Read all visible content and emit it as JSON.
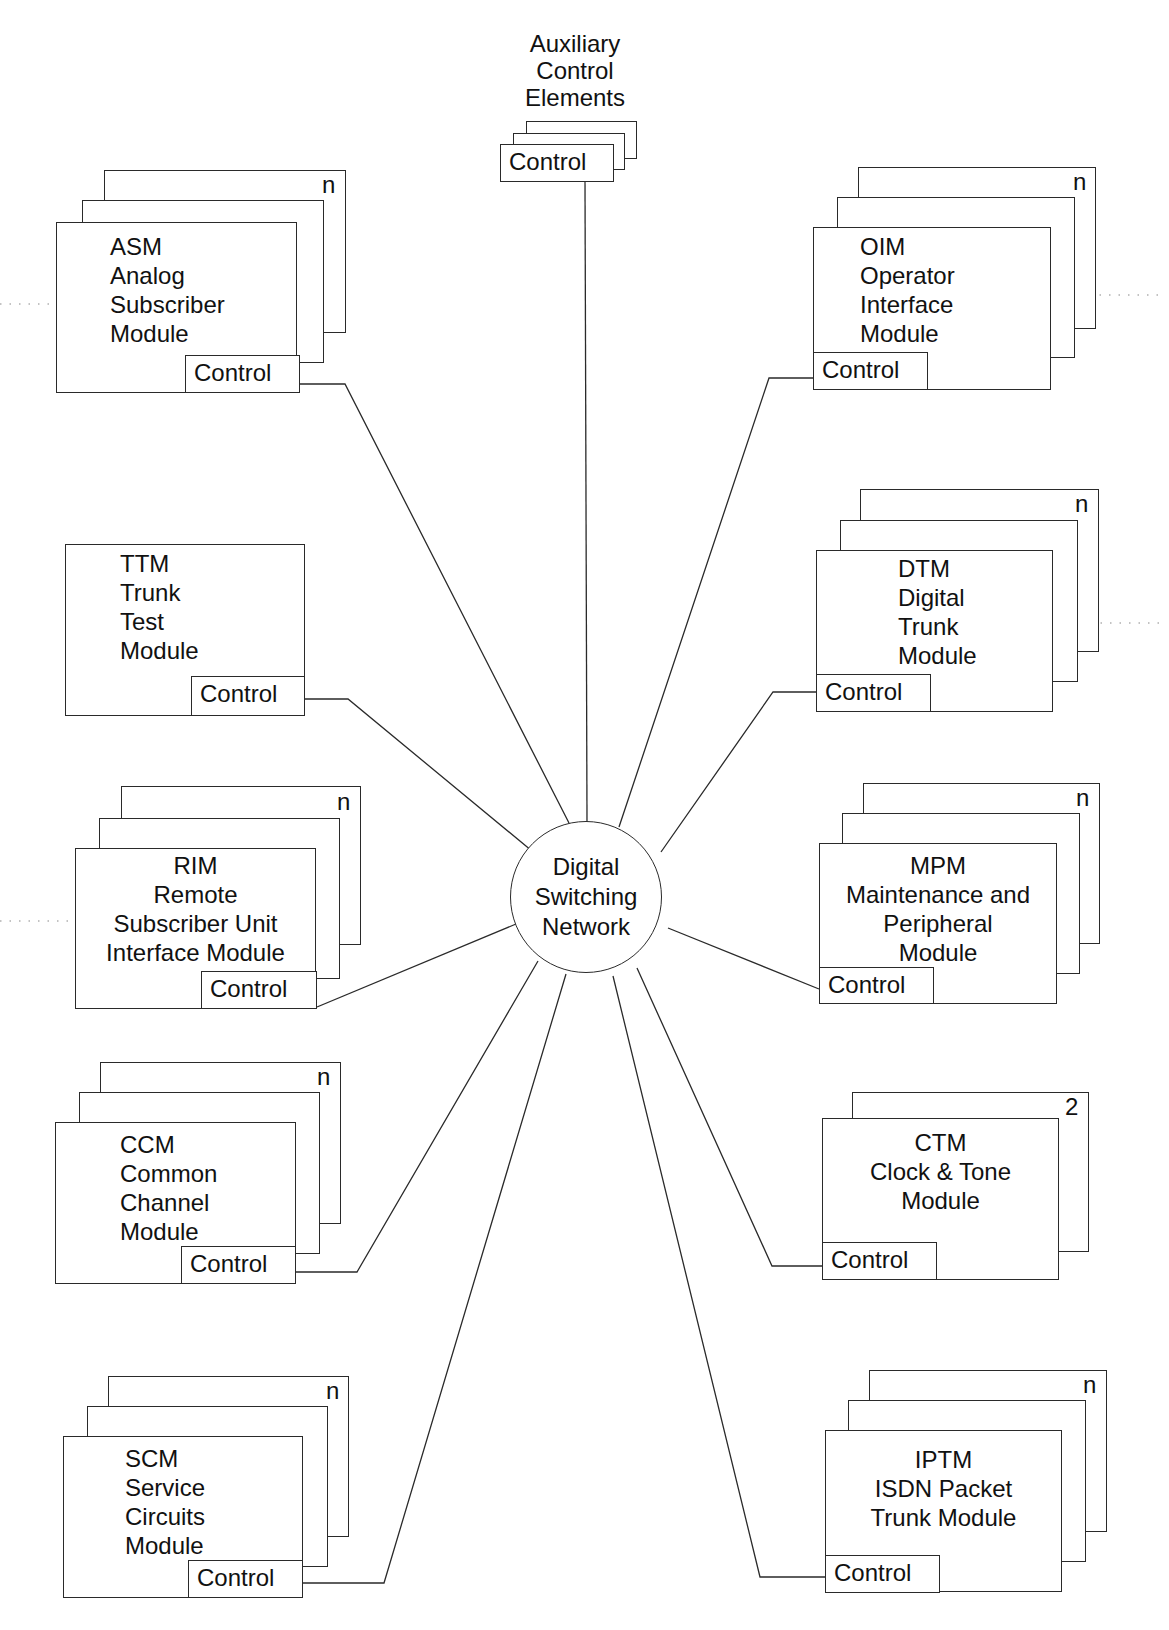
{
  "diagram": {
    "hub": {
      "label": "Digital\nSwitching\nNetwork",
      "cx": 586,
      "cy": 897,
      "r": 76
    },
    "auxiliary": {
      "title": "Auxiliary\nControl\nElements",
      "control_label": "Control",
      "title_box": [
        500,
        30,
        150,
        85
      ],
      "cards": [
        [
          526,
          121,
          111,
          38
        ],
        [
          513,
          133,
          112,
          37
        ],
        [
          500,
          144,
          114,
          38
        ]
      ]
    },
    "modules": [
      {
        "id": "asm",
        "title": "ASM\nAnalog\nSubscriber\nModule",
        "count": "n",
        "control_label": "Control",
        "cards": [
          [
            104,
            170,
            242,
            163
          ],
          [
            82,
            200,
            242,
            163
          ],
          [
            56,
            222,
            241,
            171
          ]
        ],
        "title_box": [
          110,
          232,
          130,
          120
        ],
        "title_align": "left",
        "control": [
          185,
          355,
          115,
          38
        ],
        "count_pos": [
          322,
          172
        ],
        "dotted": [
          [
            0,
            304,
            55,
            304
          ]
        ]
      },
      {
        "id": "oim",
        "title": "OIM\nOperator\nInterface\nModule",
        "count": "n",
        "control_label": "Control",
        "cards": [
          [
            858,
            167,
            238,
            162
          ],
          [
            837,
            197,
            238,
            161
          ],
          [
            813,
            227,
            238,
            163
          ]
        ],
        "title_box": [
          860,
          232,
          130,
          120
        ],
        "title_align": "left",
        "control": [
          813,
          352,
          115,
          38
        ],
        "count_pos": [
          1073,
          169
        ],
        "dotted": [
          [
            1052,
            295,
            1160,
            295
          ]
        ]
      },
      {
        "id": "ttm",
        "title": "TTM\nTrunk\nTest\nModule",
        "count": "",
        "control_label": "Control",
        "cards": [
          [
            65,
            544,
            240,
            172
          ]
        ],
        "title_box": [
          120,
          549,
          110,
          120
        ],
        "title_align": "left",
        "control": [
          191,
          676,
          114,
          40
        ],
        "count_pos": [
          0,
          0
        ],
        "dotted": []
      },
      {
        "id": "dtm",
        "title": "DTM\nDigital\nTrunk\nModule",
        "count": "n",
        "control_label": "Control",
        "cards": [
          [
            860,
            489,
            239,
            163
          ],
          [
            840,
            520,
            238,
            162
          ],
          [
            816,
            550,
            237,
            162
          ]
        ],
        "title_box": [
          898,
          554,
          120,
          116
        ],
        "title_align": "left",
        "control": [
          816,
          674,
          115,
          38
        ],
        "count_pos": [
          1075,
          491
        ],
        "dotted": [
          [
            1053,
            623,
            1160,
            623
          ]
        ]
      },
      {
        "id": "rim",
        "title": "RIM\nRemote\nSubscriber Unit\nInterface Module",
        "count": "n",
        "control_label": "Control",
        "cards": [
          [
            121,
            786,
            240,
            159
          ],
          [
            99,
            818,
            241,
            161
          ],
          [
            75,
            848,
            241,
            161
          ]
        ],
        "title_box": [
          75,
          851,
          241,
          120
        ],
        "title_align": "center",
        "control": [
          201,
          971,
          116,
          38
        ],
        "count_pos": [
          337,
          789
        ],
        "dotted": [
          [
            0,
            921,
            74,
            921
          ]
        ]
      },
      {
        "id": "mpm",
        "title": "MPM\nMaintenance and\nPeripheral\nModule",
        "count": "n",
        "control_label": "Control",
        "cards": [
          [
            863,
            783,
            237,
            161
          ],
          [
            842,
            813,
            238,
            161
          ],
          [
            819,
            843,
            238,
            161
          ]
        ],
        "title_box": [
          819,
          851,
          238,
          116
        ],
        "title_align": "center",
        "control": [
          819,
          967,
          115,
          37
        ],
        "count_pos": [
          1076,
          785
        ],
        "dotted": []
      },
      {
        "id": "ccm",
        "title": "CCM\nCommon\nChannel\nModule",
        "count": "n",
        "control_label": "Control",
        "cards": [
          [
            100,
            1062,
            241,
            162
          ],
          [
            79,
            1092,
            241,
            162
          ],
          [
            55,
            1122,
            241,
            162
          ]
        ],
        "title_box": [
          120,
          1130,
          120,
          120
        ],
        "title_align": "left",
        "control": [
          181,
          1246,
          115,
          38
        ],
        "count_pos": [
          317,
          1064
        ],
        "dotted": []
      },
      {
        "id": "ctm",
        "title": "CTM\nClock & Tone\nModule",
        "count": "2",
        "control_label": "Control",
        "cards": [
          [
            852,
            1092,
            237,
            160
          ],
          [
            822,
            1118,
            237,
            162
          ]
        ],
        "title_box": [
          822,
          1128,
          237,
          100
        ],
        "title_align": "center",
        "control": [
          822,
          1242,
          115,
          38
        ],
        "count_pos": [
          1065,
          1094
        ],
        "dotted": []
      },
      {
        "id": "scm",
        "title": "SCM\nService\nCircuits\nModule",
        "count": "n",
        "control_label": "Control",
        "cards": [
          [
            108,
            1376,
            241,
            161
          ],
          [
            87,
            1406,
            241,
            161
          ],
          [
            63,
            1436,
            240,
            162
          ]
        ],
        "title_box": [
          125,
          1444,
          120,
          120
        ],
        "title_align": "left",
        "control": [
          188,
          1560,
          115,
          38
        ],
        "count_pos": [
          326,
          1378
        ],
        "dotted": []
      },
      {
        "id": "iptm",
        "title": "IPTM\nISDN Packet\nTrunk Module",
        "count": "n",
        "control_label": "Control",
        "cards": [
          [
            869,
            1370,
            238,
            162
          ],
          [
            848,
            1400,
            238,
            162
          ],
          [
            825,
            1430,
            237,
            162
          ]
        ],
        "title_box": [
          825,
          1445,
          237,
          100
        ],
        "title_align": "center",
        "control": [
          825,
          1555,
          115,
          38
        ],
        "count_pos": [
          1083,
          1372
        ],
        "dotted": []
      }
    ],
    "connectors": [
      {
        "id": "aux-to-hub",
        "points": [
          [
            585,
            182
          ],
          [
            587,
            822
          ]
        ]
      },
      {
        "id": "asm-to-hub",
        "points": [
          [
            300,
            384
          ],
          [
            345,
            384
          ],
          [
            569,
            823
          ]
        ]
      },
      {
        "id": "oim-to-hub",
        "points": [
          [
            813,
            378
          ],
          [
            769,
            378
          ],
          [
            619,
            827
          ]
        ]
      },
      {
        "id": "ttm-to-hub",
        "points": [
          [
            305,
            699
          ],
          [
            348,
            699
          ],
          [
            532,
            851
          ]
        ]
      },
      {
        "id": "dtm-to-hub",
        "points": [
          [
            816,
            692
          ],
          [
            773,
            692
          ],
          [
            661,
            852
          ]
        ]
      },
      {
        "id": "rim-to-hub",
        "points": [
          [
            317,
            1007
          ],
          [
            516,
            924
          ]
        ]
      },
      {
        "id": "mpm-to-hub",
        "points": [
          [
            819,
            989
          ],
          [
            668,
            928
          ]
        ]
      },
      {
        "id": "ccm-to-hub",
        "points": [
          [
            296,
            1272
          ],
          [
            357,
            1272
          ],
          [
            538,
            961
          ]
        ]
      },
      {
        "id": "ctm-to-hub",
        "points": [
          [
            822,
            1266
          ],
          [
            772,
            1266
          ],
          [
            637,
            968
          ]
        ]
      },
      {
        "id": "scm-to-hub",
        "points": [
          [
            303,
            1583
          ],
          [
            384,
            1583
          ],
          [
            566,
            974
          ]
        ]
      },
      {
        "id": "iptm-to-hub",
        "points": [
          [
            825,
            1577
          ],
          [
            760,
            1577
          ],
          [
            613,
            976
          ]
        ]
      }
    ],
    "colors": {
      "stroke": "#2a2a2a",
      "background": "#ffffff",
      "text": "#111111",
      "dotted": "#888888"
    }
  }
}
